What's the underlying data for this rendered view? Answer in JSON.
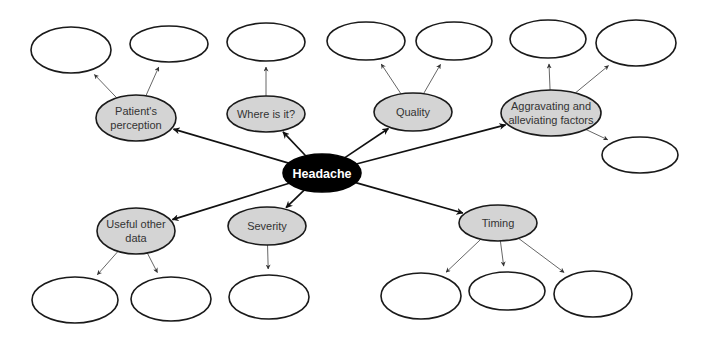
{
  "diagram": {
    "type": "mind-map",
    "root": {
      "id": "headache",
      "label": "Headache",
      "color": "#000000"
    },
    "category_fill": "#d4d4d4",
    "categories": [
      {
        "id": "patients-perception",
        "lines": [
          "Patient's",
          "perception"
        ],
        "empty_children": 2
      },
      {
        "id": "where-is-it",
        "lines": [
          "Where is it?"
        ],
        "empty_children": 1
      },
      {
        "id": "quality",
        "lines": [
          "Quality"
        ],
        "empty_children": 2
      },
      {
        "id": "aggravating-alleviating",
        "lines": [
          "Aggravating and",
          "alleviating factors"
        ],
        "empty_children": 3
      },
      {
        "id": "useful-other-data",
        "lines": [
          "Useful other",
          "data"
        ],
        "empty_children": 2
      },
      {
        "id": "severity",
        "lines": [
          "Severity"
        ],
        "empty_children": 1
      },
      {
        "id": "timing",
        "lines": [
          "Timing"
        ],
        "empty_children": 3
      }
    ]
  }
}
